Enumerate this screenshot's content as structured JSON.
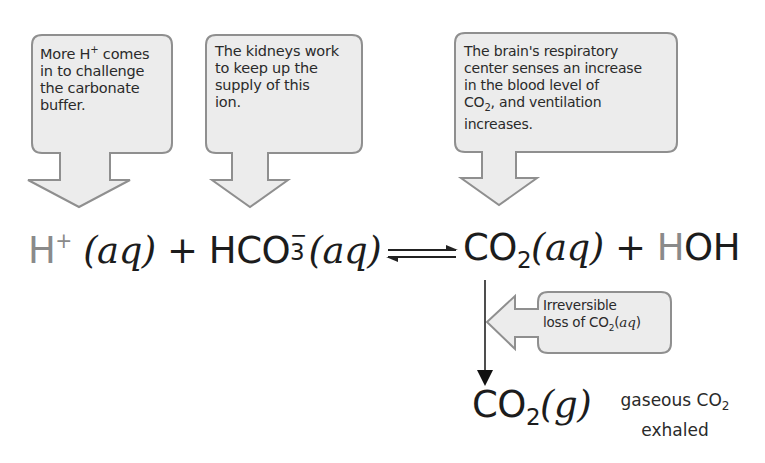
{
  "callouts": [
    {
      "id": "h-plus",
      "lines": [
        "More H",
        " comes",
        "in to challenge",
        "the carbonate",
        "buffer."
      ],
      "superscript": "+"
    },
    {
      "id": "kidneys",
      "lines": [
        "The kidneys work",
        "to keep up the",
        "supply of this",
        "ion."
      ]
    },
    {
      "id": "brain",
      "lines": [
        "The brain's respiratory",
        "center senses an increase",
        "in the blood level of",
        "CO",
        "2",
        ", and ventilation",
        "increases."
      ]
    },
    {
      "id": "irreversible",
      "lines": [
        "Irreversible",
        "loss of CO",
        "2",
        "(",
        "aq",
        ")"
      ]
    }
  ],
  "equation": {
    "h": "H",
    "h_charge": "+",
    "aq1": "(aq)",
    "plus1": "+",
    "hco3": "HCO",
    "hco3_sub": "3",
    "hco3_charge": "−",
    "aq2": "(aq)",
    "co2": "CO",
    "co2_sub": "2",
    "aq3": "(aq)",
    "plus2": "+",
    "hoh_h": "H",
    "hoh_rest": "OH"
  },
  "product": {
    "co2": "CO",
    "co2_sub": "2",
    "state": "(g)",
    "label_line1": "gaseous CO",
    "label_sub": "2",
    "label_line2": "exhaled"
  },
  "colors": {
    "callout_fill": "#ececec",
    "callout_stroke": "#8f8f8f",
    "text": "#1c1c1c",
    "grey_h": "#8a8a8a"
  }
}
